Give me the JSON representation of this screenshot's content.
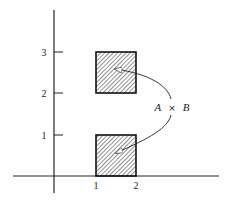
{
  "diagram": {
    "axes": {
      "x_ticks": [
        {
          "value": 1,
          "label": "1"
        },
        {
          "value": 2,
          "label": "2"
        }
      ],
      "y_ticks": [
        {
          "value": 1,
          "label": "1"
        },
        {
          "value": 2,
          "label": "2"
        },
        {
          "value": 3,
          "label": "3"
        }
      ]
    },
    "regions": [
      {
        "name": "upper-square",
        "x_range": [
          1,
          2
        ],
        "y_range": [
          2,
          3
        ],
        "fill": "hatched"
      },
      {
        "name": "lower-square",
        "x_range": [
          1,
          2
        ],
        "y_range": [
          0,
          1
        ],
        "fill": "hatched"
      }
    ],
    "annotation": {
      "left": "A",
      "operator": "×",
      "right": "B"
    },
    "colors": {
      "ink": "#222222",
      "background": "#ffffff"
    }
  }
}
